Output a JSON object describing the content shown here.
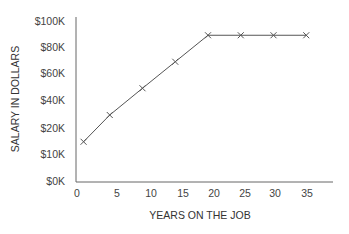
{
  "chart_data": {
    "type": "line",
    "title": "",
    "xlabel": "YEARS ON THE JOB",
    "ylabel": "SALARY IN DOLLARS",
    "x_ticks": [
      "0",
      "5",
      "10",
      "15",
      "20",
      "25",
      "30",
      "35"
    ],
    "y_ticks": [
      "$0K",
      "$10K",
      "$20K",
      "$40K",
      "$60K",
      "$80K",
      "$100K"
    ],
    "y_axis_note": "tick labels are evenly spaced but non-linear ($0K, $10K, $20K, $40K, $60K, $80K, $100K)",
    "xlim": [
      0,
      38
    ],
    "ylim": [
      0,
      100000
    ],
    "grid": false,
    "legend": null,
    "marker": "x",
    "series": [
      {
        "name": "Salary",
        "x": [
          1,
          5,
          10,
          15,
          20,
          25,
          30,
          35
        ],
        "y": [
          15000,
          30000,
          50000,
          70000,
          90000,
          90000,
          90000,
          90000
        ]
      }
    ],
    "colors": {
      "line": "#555555",
      "axis": "#666666",
      "text": "#444444"
    }
  }
}
